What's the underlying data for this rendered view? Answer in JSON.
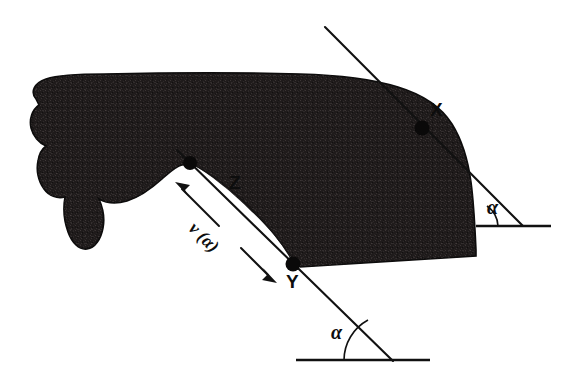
{
  "figure": {
    "caption": "",
    "background_color": "#ffffff",
    "blob_color": "#1c1a1a",
    "line_color": "#111111",
    "labels": {
      "point_x": "X",
      "point_y": "Y",
      "point_z": "Z",
      "alpha_upper": "α",
      "alpha_lower": "α",
      "width_function": "v (α)"
    },
    "elements": {
      "blob_name": "shaded-set-region",
      "notch_name": "concave-notch",
      "tangent_upper_name": "tangent-line-through-x",
      "chord_lower_name": "chord-line-through-z-and-y",
      "arrow_name": "width-double-arrow",
      "arc_upper_name": "angle-arc-upper",
      "arc_lower_name": "angle-arc-lower",
      "baseline_upper_name": "horizontal-reference-upper",
      "baseline_lower_name": "horizontal-reference-lower"
    },
    "points": {
      "x": {
        "cx": 422,
        "cy": 128,
        "r": 7.5
      },
      "y": {
        "cx": 293,
        "cy": 264,
        "r": 7.5
      },
      "z": {
        "cx": 190,
        "cy": 163,
        "r": 7.0
      }
    },
    "label_positions": {
      "point_x": {
        "left": 430,
        "top": 102
      },
      "point_y": {
        "left": 285,
        "top": 272
      },
      "point_z": {
        "left": 229,
        "top": 172
      },
      "alpha_upper": {
        "left": 487,
        "top": 198
      },
      "alpha_lower": {
        "left": 330,
        "top": 322
      },
      "width_function": {
        "left": 196,
        "top": 214,
        "rotate": 45
      }
    },
    "geometry": {
      "tangent_upper": {
        "x1": 325,
        "y1": 27,
        "x2": 523,
        "y2": 226
      },
      "chord_lower": {
        "x1": 177,
        "y1": 150,
        "x2": 393,
        "y2": 361
      },
      "baseline_upper": {
        "x1": 476,
        "y1": 226,
        "x2": 551,
        "y2": 226
      },
      "baseline_lower": {
        "x1": 296,
        "y1": 360,
        "x2": 430,
        "y2": 360
      },
      "arrow": {
        "x1": 175,
        "y1": 182,
        "x2": 276,
        "y2": 282
      }
    }
  }
}
